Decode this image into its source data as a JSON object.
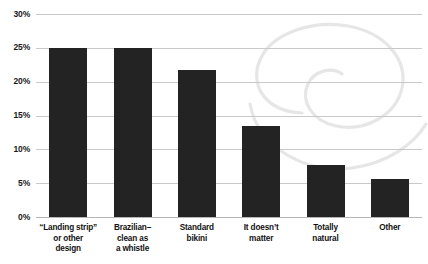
{
  "chart_data": {
    "type": "bar",
    "title": "",
    "subtitle": "",
    "xlabel": "",
    "ylabel": "",
    "ylim": [
      0,
      30
    ],
    "yticks": [
      "0%",
      "5%",
      "10%",
      "15%",
      "20%",
      "25%",
      "30%"
    ],
    "ytick_values": [
      0,
      5,
      10,
      15,
      20,
      25,
      30
    ],
    "grid": true,
    "legend": null,
    "legend_position": "none",
    "bar_color": "#232323",
    "gridline_color": "#c9c9c9",
    "watermark_color": "#e9e9e9",
    "categories": [
      "“Landing strip” or other design",
      "Brazilian–clean as a whistle",
      "Standard bikini",
      "It doesn’t matter",
      "Totally natural",
      "Other"
    ],
    "category_lines": [
      [
        "“Landing strip”",
        "or other",
        "design"
      ],
      [
        "Brazilian–",
        "clean as",
        "a whistle"
      ],
      [
        "Standard",
        "bikini"
      ],
      [
        "It doesn’t",
        "matter"
      ],
      [
        "Totally",
        "natural"
      ],
      [
        "Other"
      ]
    ],
    "values": [
      25.0,
      25.0,
      21.7,
      13.5,
      7.7,
      5.6
    ]
  }
}
